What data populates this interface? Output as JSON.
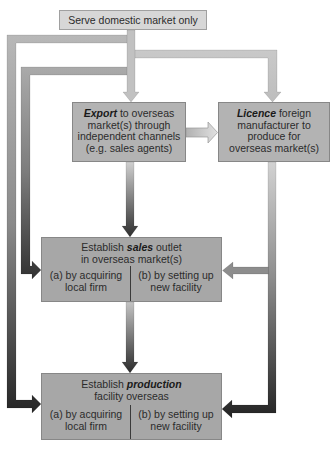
{
  "boxes": {
    "domestic": {
      "text": "Serve domestic market only"
    },
    "export": {
      "keyword": "Export",
      "first_line_rest": " to overseas",
      "lines": [
        "market(s) through",
        "independent channels",
        "(e.g. sales agents)"
      ]
    },
    "licence": {
      "keyword": "Licence",
      "first_line_rest": " foreign",
      "lines": [
        "manufacturer to",
        "produce for",
        "overseas market(s)"
      ]
    },
    "sales": {
      "prefix": "Establish ",
      "keyword": "sales",
      "suffix": " outlet",
      "line2": "in overseas market(s)",
      "option_a": [
        "(a) by acquiring",
        "local firm"
      ],
      "option_b": [
        "(b) by setting up",
        "new facility"
      ]
    },
    "production": {
      "prefix": "Establish ",
      "keyword": "production",
      "suffix": "",
      "line2": "facility overseas",
      "option_a": [
        "(a) by acquiring",
        "local firm"
      ],
      "option_b": [
        "(b) by setting up",
        "new facility"
      ]
    }
  },
  "connections": [
    {
      "from": "domestic",
      "to": "export"
    },
    {
      "from": "domestic",
      "to": "licence"
    },
    {
      "from": "domestic",
      "to": "sales"
    },
    {
      "from": "domestic",
      "to": "production"
    },
    {
      "from": "export",
      "to": "licence"
    },
    {
      "from": "export",
      "to": "sales"
    },
    {
      "from": "licence",
      "to": "sales"
    },
    {
      "from": "licence",
      "to": "production"
    },
    {
      "from": "sales",
      "to": "production"
    }
  ]
}
